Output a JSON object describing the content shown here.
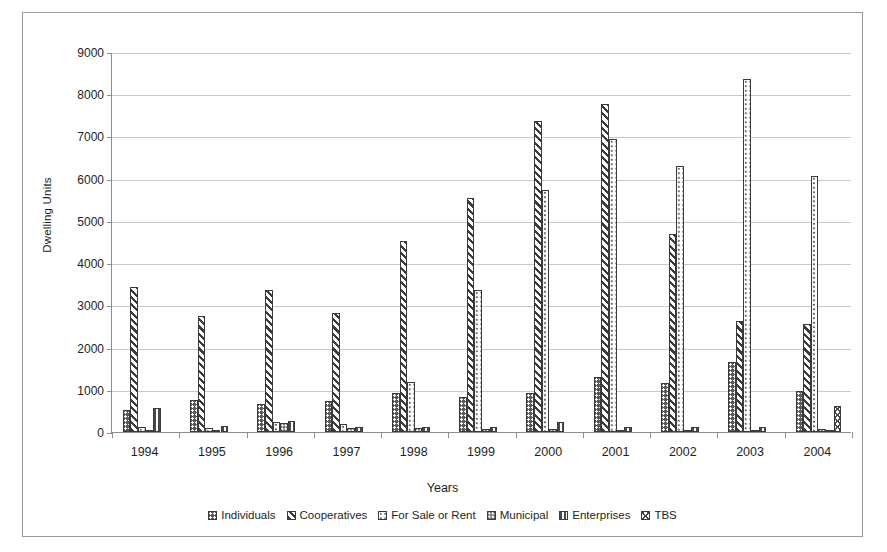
{
  "axes": {
    "ylabel": "Dwelling Units",
    "xlabel": "Years",
    "yticks": [
      "0",
      "1000",
      "2000",
      "3000",
      "4000",
      "5000",
      "6000",
      "7000",
      "8000",
      "9000"
    ]
  },
  "legend": {
    "items": [
      {
        "label": "Individuals",
        "pattern": "p-individuals"
      },
      {
        "label": "Cooperatives",
        "pattern": "p-cooperatives"
      },
      {
        "label": "For Sale or Rent",
        "pattern": "p-forsale"
      },
      {
        "label": "Municipal",
        "pattern": "p-municipal"
      },
      {
        "label": "Enterprises",
        "pattern": "p-enterprises"
      },
      {
        "label": "TBS",
        "pattern": "p-tbs"
      }
    ]
  },
  "chart_data": {
    "type": "bar",
    "title": "",
    "xlabel": "Years",
    "ylabel": "Dwelling Units",
    "ylim": [
      0,
      9000
    ],
    "grid": true,
    "legend_position": "bottom",
    "categories": [
      "1994",
      "1995",
      "1996",
      "1997",
      "1998",
      "1999",
      "2000",
      "2001",
      "2002",
      "2003",
      "2004"
    ],
    "series": [
      {
        "name": "Individuals",
        "values": [
          520,
          760,
          660,
          740,
          920,
          840,
          930,
          1300,
          1170,
          1660,
          960
        ]
      },
      {
        "name": "Cooperatives",
        "values": [
          3440,
          2740,
          3360,
          2810,
          4520,
          5540,
          7370,
          7760,
          4690,
          2620,
          2570
        ]
      },
      {
        "name": "For Sale or Rent",
        "values": [
          130,
          90,
          230,
          200,
          1180,
          3370,
          5740,
          6930,
          6310,
          8360,
          6070
        ]
      },
      {
        "name": "Municipal",
        "values": [
          50,
          40,
          220,
          100,
          90,
          70,
          60,
          50,
          50,
          40,
          60
        ]
      },
      {
        "name": "Enterprises",
        "values": [
          560,
          150,
          260,
          110,
          110,
          110,
          230,
          130,
          110,
          110,
          40
        ]
      },
      {
        "name": "TBS",
        "values": [
          0,
          0,
          0,
          0,
          0,
          0,
          0,
          0,
          0,
          0,
          620
        ]
      }
    ]
  }
}
